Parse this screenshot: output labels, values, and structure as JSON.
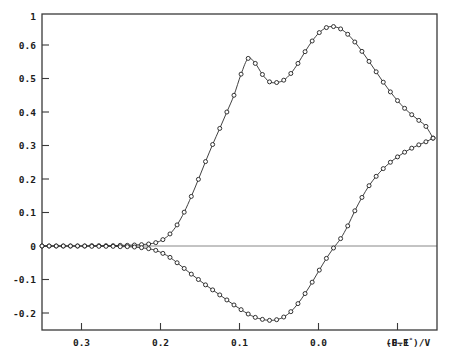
{
  "chart_data": {
    "type": "line",
    "title": "",
    "subtitle": "",
    "xlabel": "(E−E°)/V",
    "ylabel": "",
    "xlim": [
      0.35,
      -0.15
    ],
    "ylim": [
      -0.24,
      0.69
    ],
    "x_inverted": true,
    "grid": false,
    "legend": "none",
    "annotations": [],
    "x_ticks": [
      {
        "value": 0.3,
        "label": "0.3"
      },
      {
        "value": 0.2,
        "label": "0.2"
      },
      {
        "value": 0.1,
        "label": "0.1"
      },
      {
        "value": 0.0,
        "label": "0.0"
      },
      {
        "value": -0.1,
        "label": "-0.1"
      }
    ],
    "y_ticks": [
      {
        "value": 0.69,
        "label": "1"
      },
      {
        "value": 0.6,
        "label": "0.6"
      },
      {
        "value": 0.5,
        "label": "0.5"
      },
      {
        "value": 0.4,
        "label": "0.4"
      },
      {
        "value": 0.3,
        "label": "0.3"
      },
      {
        "value": 0.2,
        "label": "0.2"
      },
      {
        "value": 0.1,
        "label": "0.1"
      },
      {
        "value": 0.0,
        "label": "0"
      },
      {
        "value": -0.1,
        "label": "-0.1"
      },
      {
        "value": -0.2,
        "label": "-0.2"
      }
    ],
    "series": [
      {
        "name": "forward-scan",
        "marker": "open-circle",
        "x": [
          0.35,
          0.341,
          0.332,
          0.323,
          0.314,
          0.305,
          0.296,
          0.287,
          0.278,
          0.269,
          0.26,
          0.251,
          0.242,
          0.233,
          0.224,
          0.215,
          0.206,
          0.197,
          0.188,
          0.179,
          0.17,
          0.161,
          0.152,
          0.143,
          0.134,
          0.125,
          0.116,
          0.107,
          0.098,
          0.089,
          0.08,
          0.071,
          0.062,
          0.053,
          0.044,
          0.035,
          0.026,
          0.017,
          0.008,
          -0.001,
          -0.01,
          -0.019,
          -0.028,
          -0.037,
          -0.046,
          -0.055,
          -0.064,
          -0.073,
          -0.082,
          -0.091,
          -0.1,
          -0.109,
          -0.118,
          -0.127,
          -0.136,
          -0.145
        ],
        "y": [
          0.0,
          0.0,
          0.0,
          0.0,
          0.0,
          0.0,
          0.0,
          0.001,
          0.001,
          0.001,
          0.001,
          0.002,
          0.002,
          0.003,
          0.004,
          0.006,
          0.01,
          0.019,
          0.036,
          0.063,
          0.101,
          0.148,
          0.199,
          0.252,
          0.303,
          0.351,
          0.4,
          0.45,
          0.513,
          0.56,
          0.545,
          0.512,
          0.49,
          0.488,
          0.495,
          0.515,
          0.545,
          0.58,
          0.612,
          0.637,
          0.652,
          0.655,
          0.648,
          0.632,
          0.609,
          0.581,
          0.551,
          0.52,
          0.489,
          0.46,
          0.434,
          0.411,
          0.392,
          0.375,
          0.357,
          0.322
        ]
      },
      {
        "name": "reverse-scan",
        "marker": "open-circle",
        "x": [
          0.35,
          0.341,
          0.332,
          0.323,
          0.314,
          0.305,
          0.296,
          0.287,
          0.278,
          0.269,
          0.26,
          0.251,
          0.242,
          0.233,
          0.224,
          0.215,
          0.206,
          0.197,
          0.188,
          0.179,
          0.17,
          0.161,
          0.152,
          0.143,
          0.134,
          0.125,
          0.116,
          0.107,
          0.098,
          0.089,
          0.08,
          0.071,
          0.062,
          0.053,
          0.044,
          0.035,
          0.026,
          0.017,
          0.008,
          -0.001,
          -0.01,
          -0.019,
          -0.028,
          -0.037,
          -0.046,
          -0.055,
          -0.064,
          -0.073,
          -0.082,
          -0.091,
          -0.1,
          -0.109,
          -0.118,
          -0.127,
          -0.136,
          -0.145
        ],
        "y": [
          0.0,
          0.0,
          0.0,
          0.0,
          0.0,
          0.0,
          0.0,
          -0.001,
          -0.001,
          -0.001,
          -0.001,
          -0.002,
          -0.002,
          -0.003,
          -0.005,
          -0.008,
          -0.013,
          -0.022,
          -0.034,
          -0.05,
          -0.067,
          -0.084,
          -0.1,
          -0.116,
          -0.131,
          -0.146,
          -0.161,
          -0.176,
          -0.19,
          -0.203,
          -0.213,
          -0.219,
          -0.222,
          -0.22,
          -0.212,
          -0.196,
          -0.172,
          -0.142,
          -0.108,
          -0.072,
          -0.037,
          -0.006,
          0.022,
          0.06,
          0.105,
          0.145,
          0.18,
          0.208,
          0.231,
          0.25,
          0.266,
          0.28,
          0.292,
          0.302,
          0.311,
          0.322
        ]
      }
    ]
  }
}
